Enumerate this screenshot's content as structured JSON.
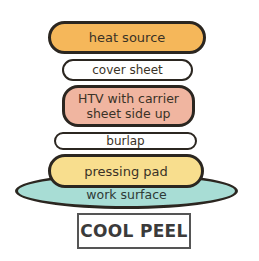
{
  "diagram": {
    "type": "layer-stack",
    "layers": [
      {
        "id": "heat-source",
        "label": "heat source",
        "color": "#F5B75A"
      },
      {
        "id": "cover-sheet",
        "label": "cover sheet",
        "color": "#FFFFFF"
      },
      {
        "id": "htv",
        "label_line1": "HTV with carrier",
        "label_line2": "sheet side up",
        "color": "#F0B5A0"
      },
      {
        "id": "burlap",
        "label": "burlap",
        "color": "#FFFFFF"
      },
      {
        "id": "pressing-pad",
        "label": "pressing pad",
        "color": "#F8DE8E"
      },
      {
        "id": "work-surface",
        "label": "work surface",
        "color": "#A8DDD5"
      }
    ],
    "peel_instruction": "COOL PEEL",
    "outline_color": "#2B2620",
    "text_color": "#3A3226"
  }
}
